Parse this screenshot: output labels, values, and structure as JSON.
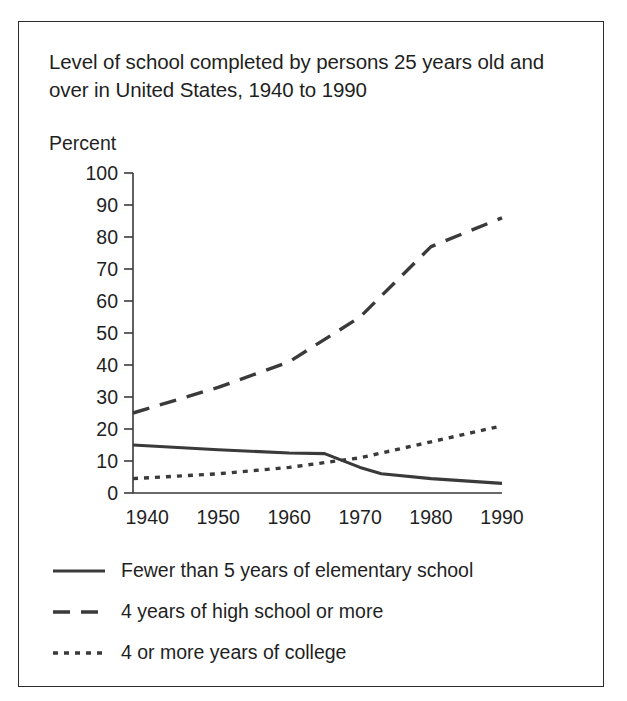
{
  "figure": {
    "title": "Level of school completed by persons 25 years old and over in United States, 1940 to 1990"
  },
  "chart_data": {
    "type": "line",
    "title": "Level of school completed by persons 25 years old and over in United States, 1940 to 1990",
    "xlabel": "",
    "ylabel": "Percent",
    "ylim": [
      0,
      100
    ],
    "xlim": [
      1938,
      1990
    ],
    "ytick_labels": [
      "0",
      "10",
      "20",
      "30",
      "40",
      "50",
      "60",
      "70",
      "80",
      "90",
      "100"
    ],
    "yticks": [
      0,
      10,
      20,
      30,
      40,
      50,
      60,
      70,
      80,
      90,
      100
    ],
    "xtick_labels": [
      "1940",
      "1950",
      "1960",
      "1970",
      "1980",
      "1990"
    ],
    "xticks": [
      1940,
      1950,
      1960,
      1970,
      1980,
      1990
    ],
    "grid": false,
    "legend_position": "below",
    "series": [
      {
        "name": "Fewer than 5 years of elementary school",
        "style": "solid",
        "color": "#3a3a3a",
        "x": [
          1938,
          1950,
          1960,
          1965,
          1970,
          1973,
          1980,
          1990
        ],
        "values": [
          15,
          13.5,
          12.5,
          12.3,
          8,
          6,
          4.5,
          3
        ]
      },
      {
        "name": "4 years of high school or more",
        "style": "dashed",
        "color": "#3a3a3a",
        "x": [
          1938,
          1950,
          1960,
          1970,
          1980,
          1990
        ],
        "values": [
          25,
          33,
          41,
          55,
          77,
          86
        ]
      },
      {
        "name": "4 or more years of college",
        "style": "dotted",
        "color": "#3a3a3a",
        "x": [
          1938,
          1950,
          1960,
          1970,
          1980,
          1990
        ],
        "values": [
          4.5,
          6,
          8,
          11,
          16,
          21
        ]
      }
    ]
  },
  "legend": {
    "items": [
      {
        "label": "Fewer than 5 years of elementary school",
        "style": "solid"
      },
      {
        "label": "4 years of high school or more",
        "style": "dashed"
      },
      {
        "label": "4 or more years of college",
        "style": "dotted"
      }
    ]
  }
}
